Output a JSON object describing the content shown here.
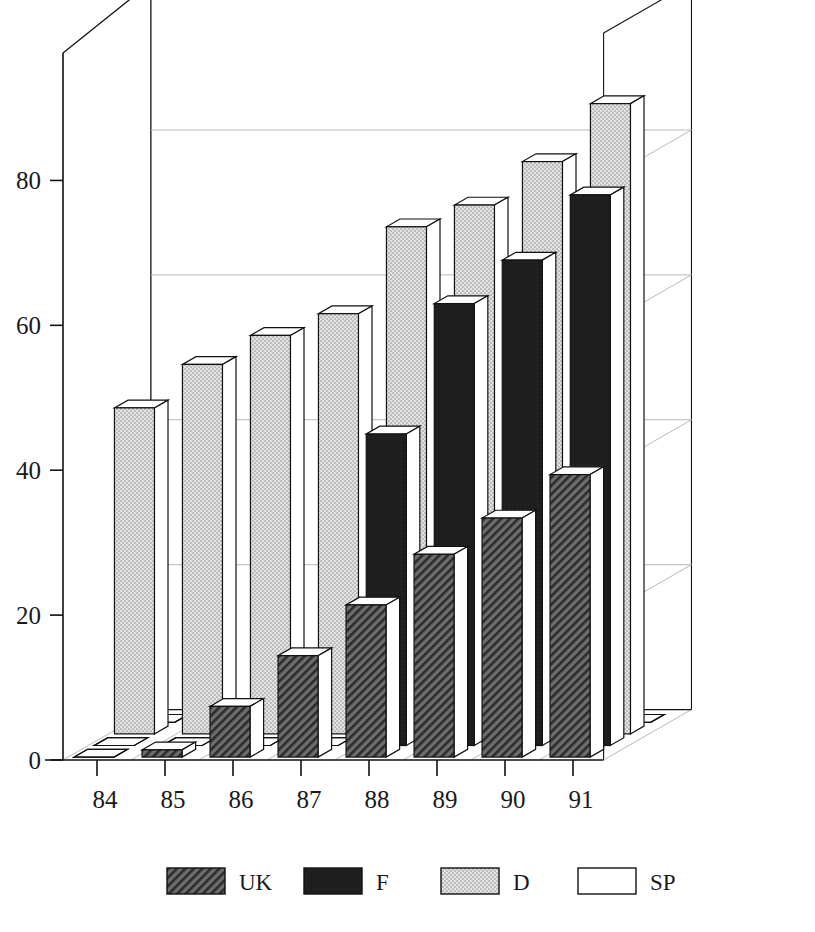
{
  "chart_data": {
    "type": "bar",
    "title": "",
    "subtitle": "",
    "xlabel": "",
    "ylabel": "",
    "categories": [
      "84",
      "85",
      "86",
      "87",
      "88",
      "89",
      "90",
      "91"
    ],
    "series": [
      {
        "name": "UK",
        "fill": "hatch-dark",
        "color": "#4a4a4a",
        "values": [
          0,
          1,
          7,
          14,
          21,
          28,
          33,
          39
        ]
      },
      {
        "name": "F",
        "fill": "solid-black",
        "color": "#1c1c1c",
        "values": [
          0,
          0,
          0,
          0,
          43,
          61,
          67,
          76
        ]
      },
      {
        "name": "D",
        "fill": "stipple-light",
        "color": "#d6d6d6",
        "values": [
          45,
          51,
          55,
          58,
          70,
          73,
          79,
          87
        ]
      },
      {
        "name": "SP",
        "fill": "white",
        "color": "#ffffff",
        "values": [
          0,
          0,
          0,
          0,
          0,
          0,
          0,
          0
        ]
      }
    ],
    "ylim": [
      0,
      90
    ],
    "yticks": [
      0,
      20,
      40,
      60,
      80
    ],
    "ytick_labels": [
      "0",
      "20",
      "40",
      "60",
      "80"
    ],
    "xtick_labels": [
      "84",
      "85",
      "86",
      "87",
      "88",
      "89",
      "90",
      "91"
    ],
    "grid": true,
    "grid_note": "horizontal gridlines on back wall at 20/40/60/80",
    "projection": "3d-bar",
    "depth_order": [
      "UK",
      "F",
      "D",
      "SP"
    ],
    "legend": {
      "position": "bottom",
      "entries": [
        {
          "label": "UK",
          "swatch": "hatch-dark"
        },
        {
          "label": "F",
          "swatch": "solid-black"
        },
        {
          "label": "D",
          "swatch": "stipple-light"
        },
        {
          "label": "SP",
          "swatch": "white"
        }
      ]
    }
  },
  "axis": {
    "y_ticks": [
      {
        "value": 80,
        "label": "80"
      },
      {
        "value": 60,
        "label": "60"
      },
      {
        "value": 40,
        "label": "40"
      },
      {
        "value": 20,
        "label": "20"
      },
      {
        "value": 0,
        "label": "0"
      }
    ],
    "x_ticks": [
      {
        "label": "84"
      },
      {
        "label": "85"
      },
      {
        "label": "86"
      },
      {
        "label": "87"
      },
      {
        "label": "88"
      },
      {
        "label": "89"
      },
      {
        "label": "90"
      },
      {
        "label": "91"
      }
    ]
  },
  "legend": {
    "items": [
      {
        "label": "UK"
      },
      {
        "label": "F"
      },
      {
        "label": "D"
      },
      {
        "label": "SP"
      }
    ]
  },
  "colors": {
    "axis": "#111111",
    "grid": "#b9b9b9",
    "outline": "#111111",
    "uk": "#4a4a4a",
    "f": "#1c1c1c",
    "d": "#d6d6d6",
    "sp": "#ffffff",
    "top_face": "#fdfdfd",
    "side_face": "#ffffff"
  }
}
